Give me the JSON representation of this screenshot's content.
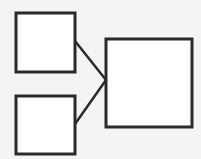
{
  "diagram": {
    "background": "#f4f4f4",
    "stroke_color": "#2a2a2a",
    "fill_color": "#ffffff",
    "nodes": [
      {
        "id": "box-top-left",
        "x": 16,
        "y": 13,
        "w": 59,
        "h": 59
      },
      {
        "id": "box-bottom-left",
        "x": 16,
        "y": 96,
        "w": 59,
        "h": 58
      },
      {
        "id": "box-right",
        "x": 106,
        "y": 39,
        "w": 86,
        "h": 88
      }
    ],
    "edges": [
      {
        "from": "box-top-left",
        "to": "box-right",
        "x1": 75,
        "y1": 41,
        "x2": 106,
        "y2": 80
      },
      {
        "from": "box-bottom-left",
        "to": "box-right",
        "x1": 75,
        "y1": 124,
        "x2": 106,
        "y2": 80
      }
    ]
  }
}
